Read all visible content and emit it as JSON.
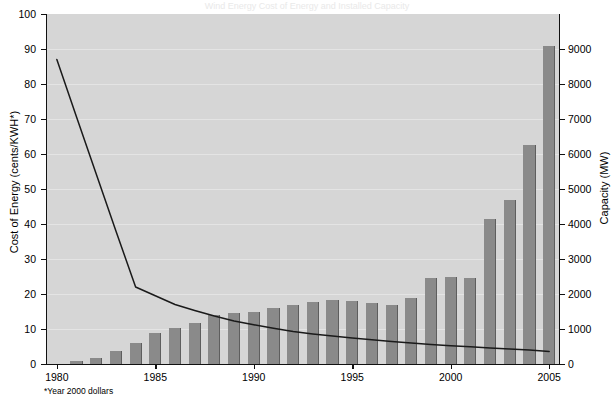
{
  "title": "Wind Energy Cost of Energy and Installed Capacity",
  "footnote": "*Year 2000 dollars",
  "axes": {
    "left_title": "Cost of Energy (cents/KWH*)",
    "right_title": "Capacity (MW)",
    "left_ticks": [
      "0",
      "10",
      "20",
      "30",
      "40",
      "50",
      "60",
      "70",
      "80",
      "90",
      "100"
    ],
    "right_ticks": [
      "0",
      "1000",
      "2000",
      "3000",
      "4000",
      "5000",
      "6000",
      "7000",
      "8000",
      "9000"
    ],
    "x_ticks": [
      "1980",
      "1985",
      "1990",
      "1995",
      "2000",
      "2005"
    ]
  },
  "colors": {
    "plot_background": "#d6d6d6",
    "gridline": "#e4e4e4",
    "bar_fill": "#8a8a8a",
    "bar_edge": "#5e5e5e",
    "line": "#1a1a1a",
    "axis": "#111111",
    "page_background": "#ffffff"
  },
  "chart_data": {
    "type": "bar",
    "title": "Wind Energy Cost of Energy and Installed Capacity",
    "xlabel": "",
    "ylabel": "Cost of Energy (cents/KWH*)",
    "y2label": "Capacity (MW)",
    "ylim": [
      0,
      100
    ],
    "y2lim": [
      0,
      10000
    ],
    "xlim": [
      1980,
      2005
    ],
    "grid": true,
    "legend": "none",
    "annotations": [
      "*Year 2000 dollars"
    ],
    "categories": [
      "1980",
      "1981",
      "1982",
      "1983",
      "1984",
      "1985",
      "1986",
      "1987",
      "1988",
      "1989",
      "1990",
      "1991",
      "1992",
      "1993",
      "1994",
      "1995",
      "1996",
      "1997",
      "1998",
      "1999",
      "2000",
      "2001",
      "2002",
      "2003",
      "2004",
      "2005"
    ],
    "series": [
      {
        "name": "Capacity (MW)",
        "type": "bar",
        "axis": "right",
        "units": "MW",
        "values": [
          10,
          90,
          180,
          380,
          600,
          900,
          1020,
          1180,
          1400,
          1450,
          1500,
          1600,
          1700,
          1780,
          1830,
          1800,
          1750,
          1680,
          1880,
          2450,
          2500,
          2450,
          4150,
          4700,
          6250,
          9100
        ]
      },
      {
        "name": "Cost of Energy (cents/KWH*)",
        "type": "line",
        "axis": "left",
        "units": "cents/KWH",
        "values": [
          87.0,
          70.6,
          54.3,
          38.0,
          22.0,
          19.5,
          17.0,
          15.3,
          13.7,
          12.3,
          11.2,
          10.2,
          9.3,
          8.6,
          8.0,
          7.4,
          6.9,
          6.4,
          6.0,
          5.6,
          5.2,
          4.9,
          4.6,
          4.3,
          4.0,
          3.6
        ]
      }
    ]
  }
}
